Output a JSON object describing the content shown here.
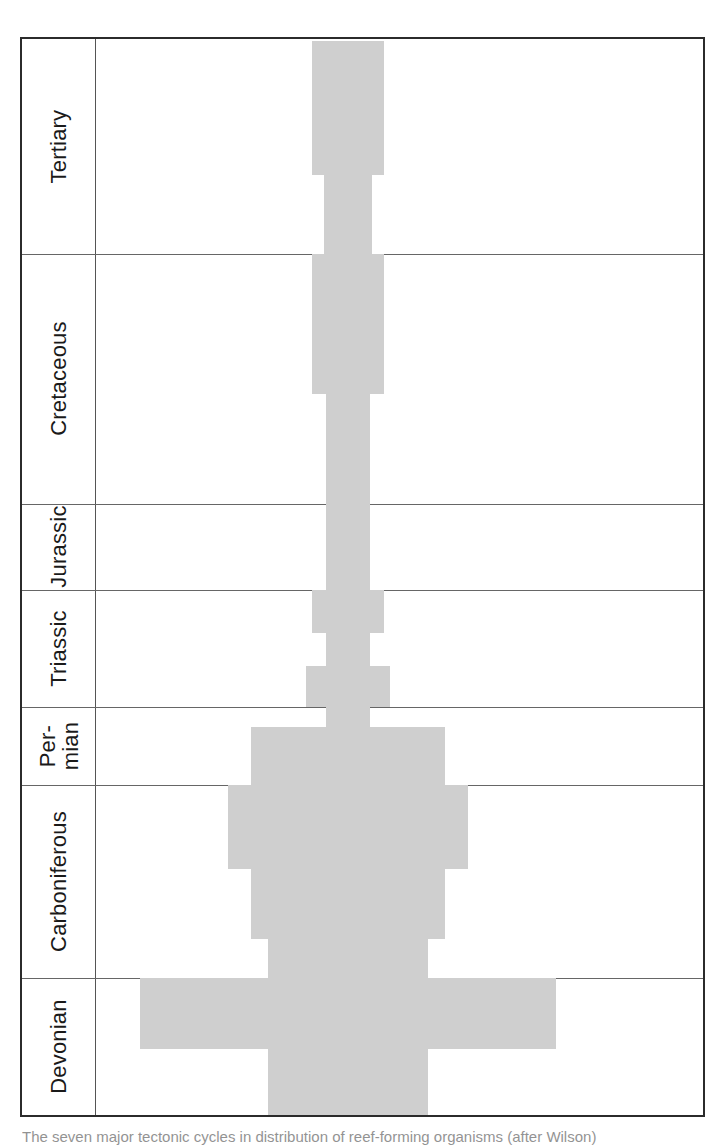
{
  "figure": {
    "kind": "spindle-diagram",
    "center_x": 326,
    "plot_width": 610,
    "top": 37,
    "bottom": 1117,
    "band_color": "#cfcfcf",
    "frame_color": "#2b2b2b",
    "rule_color": "#666666"
  },
  "caption": {
    "text": "The seven major tectonic cycles in distribution of reef-forming organisms (after Wilson)"
  },
  "periods": [
    {
      "name": "Tertiary",
      "top": 0,
      "bottom": 215,
      "two_line": false
    },
    {
      "name": "Cretaceous",
      "top": 215,
      "bottom": 465,
      "two_line": false
    },
    {
      "name": "Jurassic",
      "top": 465,
      "bottom": 551,
      "two_line": false
    },
    {
      "name": "Triassic",
      "top": 551,
      "bottom": 668,
      "two_line": false
    },
    {
      "name": "Per-\nmian",
      "top": 668,
      "bottom": 746,
      "two_line": true
    },
    {
      "name": "Carboniferous",
      "top": 746,
      "bottom": 939,
      "two_line": false
    },
    {
      "name": "Devonian",
      "top": 939,
      "bottom": 1076,
      "two_line": false
    }
  ],
  "chart_data": {
    "type": "bar",
    "orientation": "horizontal-symmetric",
    "title": "",
    "xlabel": "",
    "ylabel": "Geological period",
    "grid": true,
    "legend": null,
    "categories": [
      "Tertiary",
      "Cretaceous",
      "Jurassic",
      "Triassic",
      "Permian",
      "Carboniferous",
      "Devonian"
    ],
    "note": "Width of each grey band is proportional to abundance/diversity; bands are mirrored about the vertical centre axis.",
    "bands": [
      {
        "period": "Tertiary",
        "top": 2,
        "bottom": 136,
        "half_width": 36
      },
      {
        "period": "Tertiary",
        "top": 136,
        "bottom": 215,
        "half_width": 24
      },
      {
        "period": "Cretaceous",
        "top": 215,
        "bottom": 355,
        "half_width": 36
      },
      {
        "period": "Cretaceous",
        "top": 355,
        "bottom": 465,
        "half_width": 22
      },
      {
        "period": "Jurassic",
        "top": 465,
        "bottom": 551,
        "half_width": 22
      },
      {
        "period": "Triassic",
        "top": 551,
        "bottom": 594,
        "half_width": 36
      },
      {
        "period": "Triassic",
        "top": 594,
        "bottom": 627,
        "half_width": 22
      },
      {
        "period": "Triassic",
        "top": 627,
        "bottom": 668,
        "half_width": 42
      },
      {
        "period": "Permian",
        "top": 668,
        "bottom": 688,
        "half_width": 22
      },
      {
        "period": "Permian",
        "top": 688,
        "bottom": 746,
        "half_width": 97
      },
      {
        "period": "Carboniferous",
        "top": 746,
        "bottom": 830,
        "half_width": 120
      },
      {
        "period": "Carboniferous",
        "top": 830,
        "bottom": 900,
        "half_width": 97
      },
      {
        "period": "Carboniferous",
        "top": 900,
        "bottom": 939,
        "half_width": 80
      },
      {
        "period": "Devonian",
        "top": 939,
        "bottom": 1010,
        "half_width": 208
      },
      {
        "period": "Devonian",
        "top": 1010,
        "bottom": 1076,
        "half_width": 80
      }
    ]
  }
}
